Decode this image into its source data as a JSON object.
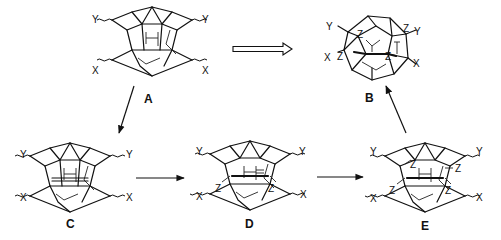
{
  "diagram": {
    "type": "reaction-scheme",
    "compounds": [
      {
        "id": "A",
        "label": "A",
        "substituents": {
          "top_left": "Y",
          "top_right": "Y",
          "bottom_left": "X",
          "bottom_right": "X"
        }
      },
      {
        "id": "B",
        "label": "B",
        "substituents": {
          "top_left": "Y",
          "top_right": "Y",
          "bottom_left": "X",
          "bottom_right": "X",
          "z_groups": [
            "Z",
            "Z",
            "Z",
            "Z"
          ]
        }
      },
      {
        "id": "C",
        "label": "C",
        "substituents": {
          "top_left": "Y",
          "top_right": "Y",
          "bottom_left": "X",
          "bottom_right": "X"
        }
      },
      {
        "id": "D",
        "label": "D",
        "substituents": {
          "top_left": "Y",
          "top_right": "Y",
          "bottom_left": "X",
          "bottom_right": "X",
          "z_groups": [
            "Z",
            "Z"
          ]
        }
      },
      {
        "id": "E",
        "label": "E",
        "substituents": {
          "top_left": "Y",
          "top_right": "Y",
          "bottom_left": "X",
          "bottom_right": "X",
          "z_groups": [
            "Z",
            "Z",
            "Z",
            "Z"
          ]
        }
      }
    ],
    "arrows": [
      {
        "from": "A",
        "to": "B",
        "style": "open-double",
        "meaning": "retrosynthetic / conceptual"
      },
      {
        "from": "A",
        "to": "C",
        "style": "solid"
      },
      {
        "from": "C",
        "to": "D",
        "style": "solid"
      },
      {
        "from": "D",
        "to": "E",
        "style": "solid"
      },
      {
        "from": "E",
        "to": "B",
        "style": "solid"
      }
    ],
    "atom_labels": {
      "x": "X",
      "y": "Y",
      "z": "Z"
    }
  }
}
